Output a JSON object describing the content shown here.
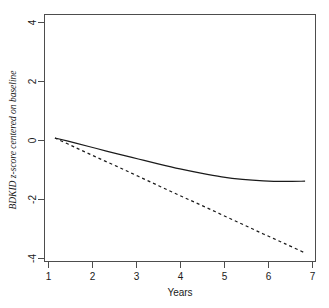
{
  "chart_data": {
    "type": "line",
    "title": "",
    "subtitle": "",
    "xlabel": "Years",
    "ylabel": "BDKID z-score centered on baseline",
    "xlim": [
      0.75,
      7.25
    ],
    "ylim": [
      -4.35,
      4.35
    ],
    "xticks": [
      1,
      2,
      3,
      4,
      5,
      6,
      7
    ],
    "xtick_labels": [
      "1",
      "2",
      "3",
      "4",
      "5",
      "6",
      "7"
    ],
    "yticks": [
      4,
      2,
      0,
      -2,
      -4
    ],
    "ytick_labels": [
      "4",
      "2",
      "0",
      "-2",
      "-4"
    ],
    "grid": false,
    "legend": "none",
    "x": [
      1,
      1.5,
      2,
      2.5,
      3,
      3.5,
      4,
      4.5,
      5,
      5.5,
      6,
      6.5,
      7
    ],
    "series": [
      {
        "name": "quadratic-trajectory",
        "style": "solid",
        "color": "#1a1a1a",
        "values": [
          0,
          -0.18,
          -0.37,
          -0.56,
          -0.74,
          -0.92,
          -1.09,
          -1.24,
          -1.37,
          -1.46,
          -1.51,
          -1.53,
          -1.52
        ]
      },
      {
        "name": "linear-trajectory",
        "style": "dashed",
        "color": "#1a1a1a",
        "values": [
          0,
          -0.34,
          -0.68,
          -1.01,
          -1.35,
          -1.69,
          -2.03,
          -2.36,
          -2.7,
          -3.04,
          -3.38,
          -3.71,
          -4.05
        ]
      }
    ]
  },
  "axes": {
    "x_label": "Years",
    "y_label": "BDKID z-score centered on baseline"
  }
}
